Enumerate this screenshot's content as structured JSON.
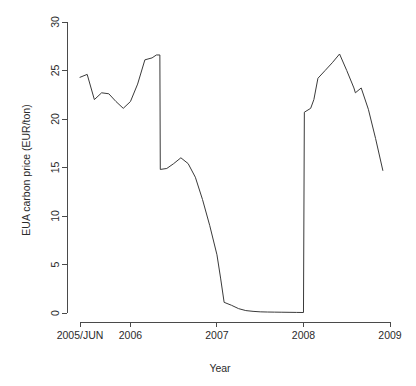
{
  "figure": {
    "background_color": "#ffffff",
    "line_color": "#3a3a3a",
    "axis_color": "#4a4a4a"
  },
  "chart_data": {
    "type": "line",
    "title": "",
    "subtitle": "",
    "xlabel": "Year",
    "ylabel": "EUA carbon price (EUR/ton)",
    "xlim": [
      2005.417,
      2009.0
    ],
    "ylim": [
      0,
      30
    ],
    "grid": false,
    "legend": false,
    "legend_position": "none",
    "x_tick_labels": [
      "2005/JUN",
      "2006",
      "2007",
      "2008",
      "2009"
    ],
    "x_tick_values": [
      2005.417,
      2006,
      2007,
      2008,
      2009
    ],
    "y_tick_labels": [
      "0",
      "5",
      "10",
      "15",
      "20",
      "25",
      "30"
    ],
    "y_tick_values": [
      0,
      5,
      10,
      15,
      20,
      25,
      30
    ],
    "series": [
      {
        "name": "EUA carbon price",
        "x": [
          2005.417,
          2005.5,
          2005.583,
          2005.667,
          2005.75,
          2005.833,
          2005.917,
          2006.0,
          2006.083,
          2006.167,
          2006.25,
          2006.3,
          2006.34,
          2006.345,
          2006.42,
          2006.5,
          2006.583,
          2006.667,
          2006.75,
          2006.833,
          2006.917,
          2007.0,
          2007.042,
          2007.083,
          2007.167,
          2007.25,
          2007.333,
          2007.417,
          2007.5,
          2007.583,
          2007.667,
          2007.75,
          2007.833,
          2007.917,
          2008.0,
          2008.01,
          2008.083,
          2008.12,
          2008.167,
          2008.25,
          2008.333,
          2008.417,
          2008.5,
          2008.583,
          2008.6,
          2008.667,
          2008.75,
          2008.833,
          2008.917
        ],
        "values": [
          24.3,
          24.6,
          22.0,
          22.7,
          22.6,
          21.8,
          21.1,
          21.8,
          23.6,
          26.1,
          26.3,
          26.6,
          26.6,
          14.8,
          14.9,
          15.4,
          16.0,
          15.4,
          14.0,
          11.7,
          9.0,
          6.0,
          3.6,
          1.1,
          0.8,
          0.45,
          0.25,
          0.17,
          0.12,
          0.1,
          0.09,
          0.08,
          0.07,
          0.06,
          0.05,
          20.7,
          21.1,
          22.0,
          24.2,
          25.0,
          25.8,
          26.7,
          25.0,
          23.2,
          22.7,
          23.2,
          21.0,
          18.0,
          14.7
        ]
      }
    ],
    "annotations": []
  }
}
